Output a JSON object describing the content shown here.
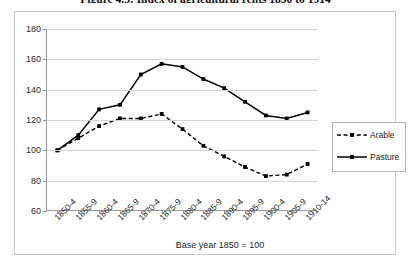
{
  "figure": {
    "title": "Figure 4.5: Index of agricultural rents 1850 to 1914",
    "caption": "Base year 1850 = 100"
  },
  "legend": {
    "position": "right",
    "entries": [
      {
        "label": "Arable",
        "style": "dashed",
        "marker": "square",
        "color": "#000000"
      },
      {
        "label": "Pasture",
        "style": "solid",
        "marker": "square",
        "color": "#000000"
      }
    ]
  },
  "chart_data": {
    "type": "line",
    "title": "Figure 4.5: Index of agricultural rents 1850 to 1914",
    "subtitle": "",
    "xlabel": "Base year 1850 = 100",
    "ylabel": "",
    "grid": true,
    "legend_position": "right",
    "ylim": [
      60,
      180
    ],
    "yticks": [
      60,
      80,
      100,
      120,
      140,
      160,
      180
    ],
    "categories": [
      "1850-4",
      "1855-9",
      "1860-4",
      "1865-9",
      "1870-4",
      "1875-9",
      "1880-4",
      "1885-9",
      "1890-4",
      "1895-9",
      "1900-4",
      "1905-9",
      "1910-14"
    ],
    "series": [
      {
        "name": "Arable",
        "values": [
          100,
          108,
          116,
          121,
          121,
          124,
          114,
          103,
          96,
          89,
          83,
          84,
          91
        ]
      },
      {
        "name": "Pasture",
        "values": [
          100,
          110,
          127,
          130,
          150,
          157,
          155,
          147,
          141,
          132,
          123,
          121,
          125
        ]
      }
    ]
  }
}
